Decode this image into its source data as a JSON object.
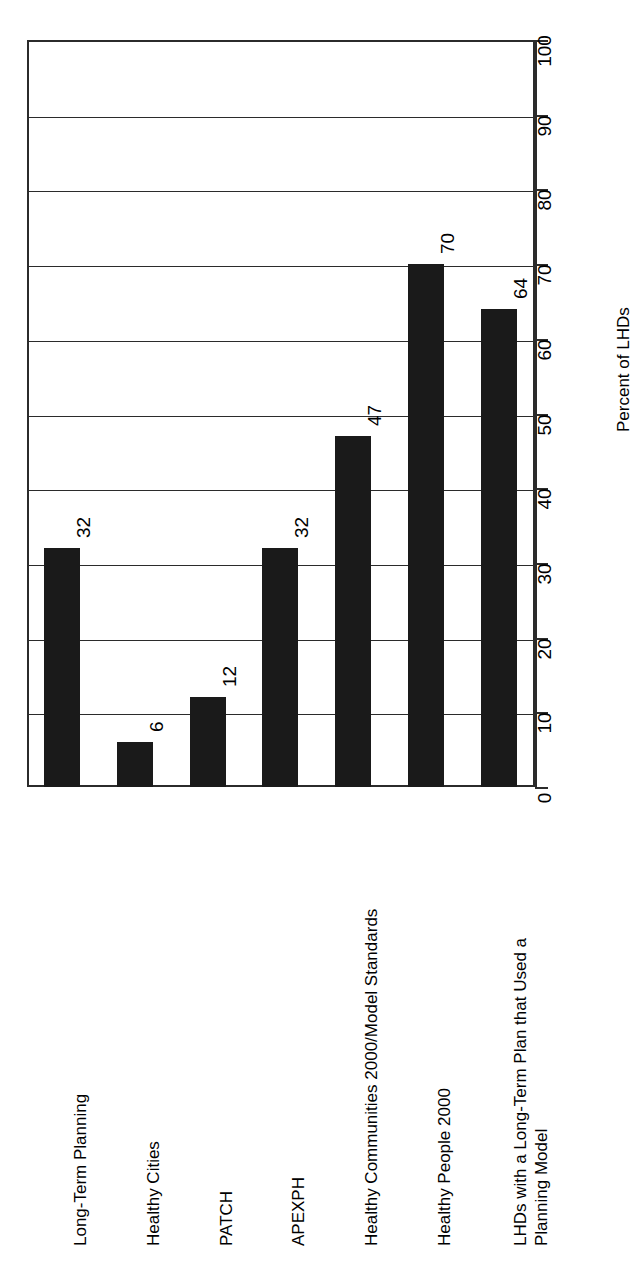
{
  "chart_data": {
    "type": "bar",
    "title": "",
    "orientation": "rotated-90",
    "categories": [
      "Long-Term Planning",
      "Healthy Cities",
      "PATCH",
      "APEXPH",
      "Healthy Communities 2000/Model Standards",
      "Healthy People 2000",
      "LHDs with a Long-Term Plan that Used a\nPlanning Model"
    ],
    "values": [
      32,
      6,
      12,
      32,
      47,
      70,
      64
    ],
    "value_labels": [
      "32",
      "6",
      "12",
      "32",
      "47",
      "70",
      "64"
    ],
    "xlabel": "",
    "ylabel": "Percent of LHDs",
    "ylim": [
      0,
      100
    ],
    "tick_labels": [
      "0",
      "10",
      "20",
      "30",
      "40",
      "50",
      "60",
      "70",
      "80",
      "90",
      "100"
    ],
    "tick_values": [
      0,
      10,
      20,
      30,
      40,
      50,
      60,
      70,
      80,
      90,
      100
    ],
    "grid": true,
    "legend": "none",
    "bar_color": "#1a1a1a",
    "axis_color": "#2b2b2b",
    "background_color": "#ffffff"
  }
}
